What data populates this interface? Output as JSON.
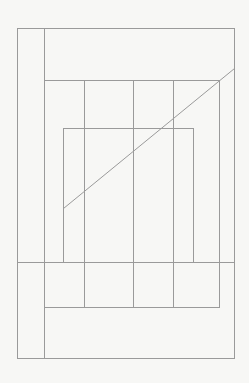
{
  "figure": {
    "kind": "line-drawing",
    "width": 249,
    "height": 383,
    "background_color": "#f7f7f5",
    "line_color": "#9a9a9a",
    "line_width": 1,
    "shapes": {
      "outer_rectangle": {
        "name": "outer-rectangle",
        "x1": 17,
        "y1": 28,
        "x2": 234,
        "y2": 358
      },
      "middle_rectangle": {
        "name": "middle-rectangle",
        "x1": 44,
        "y1": 80,
        "x2": 219,
        "y2": 307
      },
      "inner_rectangle": {
        "name": "inner-rectangle",
        "x1": 63,
        "y1": 128,
        "x2": 193,
        "y2": 262
      },
      "left_spine": {
        "name": "left-spine-vertical",
        "x": 44,
        "y1": 28,
        "y2": 358
      },
      "cross_band": {
        "name": "cross-band-horizontal",
        "y": 262,
        "x1": 17,
        "x2": 234
      },
      "column_dividers": [
        {
          "name": "column-divider-1",
          "x": 84,
          "y1": 80,
          "y2": 307
        },
        {
          "name": "column-divider-2",
          "x": 133,
          "y1": 80,
          "y2": 307
        },
        {
          "name": "column-divider-3",
          "x": 173,
          "y1": 80,
          "y2": 307
        }
      ],
      "diagonal": {
        "name": "diagonal-line",
        "x1": 63,
        "y1": 208,
        "x2": 234,
        "y2": 68
      }
    }
  }
}
